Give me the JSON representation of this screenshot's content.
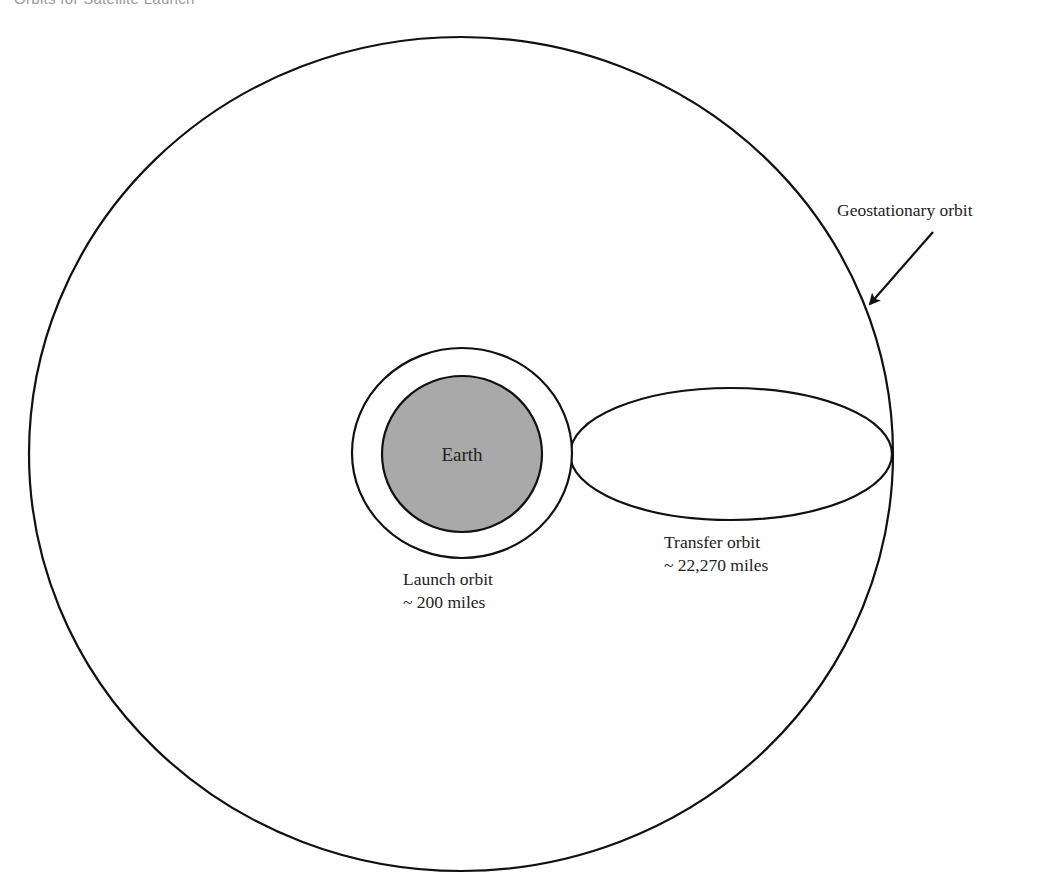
{
  "figure": {
    "title": "Orbits for Satellite Launch"
  },
  "colors": {
    "stroke": "#111111",
    "earth_fill": "#a9a9a9",
    "text": "#222222",
    "background": "#ffffff"
  },
  "labels": {
    "earth": "Earth",
    "geostationary": "Geostationary orbit",
    "launch_line1": "Launch orbit",
    "launch_line2": "~ 200 miles",
    "transfer_line1": "Transfer orbit",
    "transfer_line2": "~ 22,270 miles"
  },
  "shapes": {
    "geostationary_orbit": {
      "cx": 461,
      "cy": 454,
      "rx": 432,
      "ry": 417
    },
    "launch_orbit": {
      "cx": 462,
      "cy": 453,
      "rx": 110,
      "ry": 105
    },
    "earth": {
      "cx": 462,
      "cy": 454,
      "rx": 80,
      "ry": 78
    },
    "transfer_orbit": {
      "cx": 731,
      "cy": 454,
      "rx": 161,
      "ry": 66
    },
    "arrow": {
      "x1": 933,
      "y1": 232,
      "x2": 870,
      "y2": 304
    }
  }
}
